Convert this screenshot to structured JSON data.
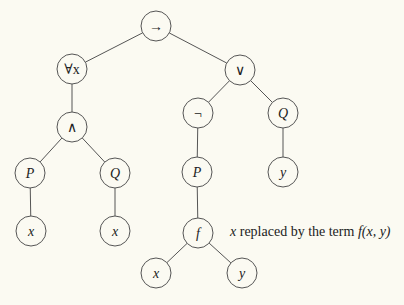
{
  "diagram": {
    "type": "syntax-tree",
    "nodes": [
      {
        "id": "root",
        "label": "→",
        "italic": false,
        "x": 156,
        "y": 26
      },
      {
        "id": "forall",
        "label": "∀x",
        "italic": false,
        "x": 72,
        "y": 69
      },
      {
        "id": "or",
        "label": "∨",
        "italic": false,
        "x": 240,
        "y": 70
      },
      {
        "id": "and",
        "label": "∧",
        "italic": false,
        "x": 72,
        "y": 127
      },
      {
        "id": "not",
        "label": "¬",
        "italic": false,
        "x": 198,
        "y": 113
      },
      {
        "id": "Q1",
        "label": "Q",
        "italic": true,
        "x": 283,
        "y": 113
      },
      {
        "id": "P1",
        "label": "P",
        "italic": true,
        "x": 30,
        "y": 173
      },
      {
        "id": "Q2",
        "label": "Q",
        "italic": true,
        "x": 115,
        "y": 173
      },
      {
        "id": "P2",
        "label": "P",
        "italic": true,
        "x": 197,
        "y": 172
      },
      {
        "id": "y1",
        "label": "y",
        "italic": true,
        "x": 283,
        "y": 172
      },
      {
        "id": "x1",
        "label": "x",
        "italic": true,
        "x": 31,
        "y": 231
      },
      {
        "id": "x2",
        "label": "x",
        "italic": true,
        "x": 115,
        "y": 231
      },
      {
        "id": "f",
        "label": "f",
        "italic": true,
        "x": 198,
        "y": 233
      },
      {
        "id": "x3",
        "label": "x",
        "italic": true,
        "x": 156,
        "y": 273
      },
      {
        "id": "y2",
        "label": "y",
        "italic": true,
        "x": 242,
        "y": 273
      }
    ],
    "edges": [
      [
        "root",
        "forall"
      ],
      [
        "root",
        "or"
      ],
      [
        "forall",
        "and"
      ],
      [
        "and",
        "P1"
      ],
      [
        "and",
        "Q2"
      ],
      [
        "P1",
        "x1"
      ],
      [
        "Q2",
        "x2"
      ],
      [
        "or",
        "not"
      ],
      [
        "or",
        "Q1"
      ],
      [
        "not",
        "P2"
      ],
      [
        "Q1",
        "y1"
      ],
      [
        "P2",
        "f"
      ],
      [
        "f",
        "x3"
      ],
      [
        "f",
        "y2"
      ]
    ],
    "node_radius": 15
  },
  "annotation": {
    "prefix_var": "x",
    "text": " replaced by the term ",
    "term": "f(x, y)"
  }
}
